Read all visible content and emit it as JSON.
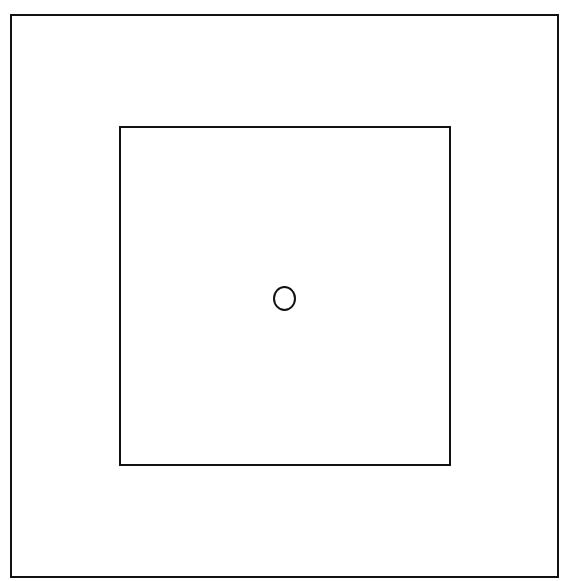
{
  "diagram": {
    "shapes": [
      {
        "id": "outer-square",
        "type": "rectangle",
        "x": 10,
        "y": 14,
        "width": 547,
        "height": 562,
        "stroke": "#111111",
        "fill": "#ffffff"
      },
      {
        "id": "inner-square",
        "type": "rectangle",
        "x": 119,
        "y": 126,
        "width": 330,
        "height": 338,
        "stroke": "#111111",
        "fill": "#ffffff"
      },
      {
        "id": "center-circle",
        "type": "ellipse",
        "cx": 284,
        "cy": 297,
        "rx": 11,
        "ry": 12,
        "stroke": "#111111",
        "fill": "none"
      }
    ],
    "colors": {
      "stroke": "#111111",
      "background": "#ffffff"
    }
  }
}
